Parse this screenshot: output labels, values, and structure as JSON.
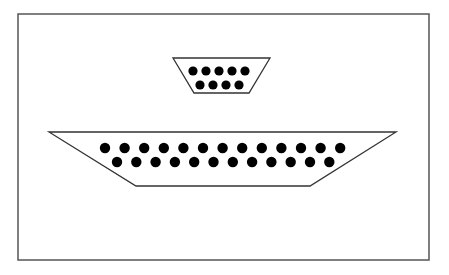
{
  "diagram": {
    "frame": {
      "x": 18,
      "y": 14,
      "width": 411,
      "height": 246,
      "stroke": "#555555"
    },
    "connectors": [
      {
        "name": "de9-connector",
        "outline": {
          "top_left": [
            173,
            58
          ],
          "top_right": [
            270,
            58
          ],
          "bottom_right": [
            249,
            93
          ],
          "bottom_left": [
            194,
            93
          ]
        },
        "rows": [
          {
            "y": 71,
            "start_x": 193,
            "spacing": 13,
            "count": 5
          },
          {
            "y": 85,
            "start_x": 200,
            "spacing": 13,
            "count": 4
          }
        ],
        "pin_radius": 4.6
      },
      {
        "name": "db25-connector",
        "outline": {
          "top_left": [
            49,
            132
          ],
          "top_right": [
            396,
            132
          ],
          "bottom_right": [
            310,
            186
          ],
          "bottom_left": [
            136,
            186
          ]
        },
        "rows": [
          {
            "y": 148,
            "start_x": 105,
            "spacing": 19.6,
            "count": 13
          },
          {
            "y": 162,
            "start_x": 117,
            "spacing": 19.3,
            "count": 12
          }
        ],
        "pin_radius": 5.2
      }
    ],
    "colors": {
      "outline": "#333333",
      "pin": "#000000",
      "fill": "#ffffff"
    }
  }
}
